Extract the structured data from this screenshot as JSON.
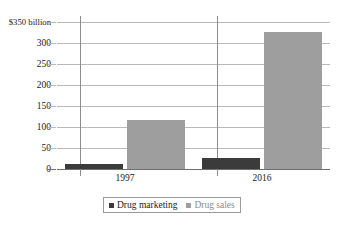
{
  "chart_data": {
    "type": "bar",
    "title": "",
    "subtitle": "",
    "xlabel": "",
    "ylabel": "",
    "categories": [
      "1997",
      "2016"
    ],
    "series": [
      {
        "name": "Drug marketing",
        "color": "#3b3b3b",
        "values": [
          12,
          25
        ]
      },
      {
        "name": "Drug sales",
        "color": "#9e9e9e",
        "values": [
          116,
          325
        ]
      }
    ],
    "ylim": [
      0,
      350
    ],
    "ytick_values": [
      0,
      50,
      100,
      150,
      200,
      250,
      300,
      350
    ],
    "ytick_labels": [
      "0",
      "50",
      "100",
      "150",
      "200",
      "250",
      "300",
      "$350 billion"
    ],
    "units": "billion US dollars",
    "grid": true,
    "legend_position": "bottom-center",
    "annotations": []
  },
  "legend": {
    "items": [
      {
        "label": "Drug marketing",
        "swatch_name": "legend-swatch-marketing"
      },
      {
        "label": "Drug sales",
        "swatch_name": "legend-swatch-sales"
      }
    ]
  },
  "colors": {
    "marketing": "#3b3b3b",
    "sales": "#9e9e9e",
    "gridline": "#b9b9b9",
    "axis": "#6f6f6f",
    "separator": "#8d8d8d",
    "background": "#ffffff"
  }
}
